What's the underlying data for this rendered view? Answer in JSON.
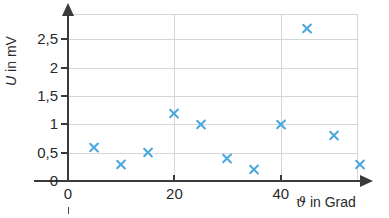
{
  "chart_data": {
    "type": "scatter",
    "title": "",
    "xlabel": "ϑ in Grad",
    "ylabel": "U in mV",
    "xlim": [
      0,
      54.5
    ],
    "ylim": [
      0,
      2.95
    ],
    "grid": true,
    "legend": null,
    "x": [
      5,
      10,
      15,
      20,
      25,
      30,
      35,
      40,
      45,
      50,
      55
    ],
    "y": [
      0.6,
      0.3,
      0.5,
      1.2,
      1.0,
      0.4,
      0.2,
      1.0,
      2.7,
      0.8,
      0.3
    ],
    "points": [
      {
        "x": 5,
        "y": 0.6
      },
      {
        "x": 10,
        "y": 0.3
      },
      {
        "x": 15,
        "y": 0.5
      },
      {
        "x": 20,
        "y": 1.2
      },
      {
        "x": 25,
        "y": 1.0
      },
      {
        "x": 30,
        "y": 0.4
      },
      {
        "x": 35,
        "y": 0.2
      },
      {
        "x": 40,
        "y": 1.0
      },
      {
        "x": 45,
        "y": 2.7
      },
      {
        "x": 50,
        "y": 0.8
      },
      {
        "x": 55,
        "y": 0.3
      }
    ],
    "marker": "x",
    "marker_color": "#4aa8dd",
    "x_ticks": [
      {
        "value": 0,
        "label": "0"
      },
      {
        "value": 20,
        "label": "20"
      },
      {
        "value": 40,
        "label": "40"
      }
    ],
    "y_ticks": [
      {
        "value": 0,
        "label": "0"
      },
      {
        "value": 0.5,
        "label": "0,5"
      },
      {
        "value": 1.0,
        "label": "1"
      },
      {
        "value": 1.5,
        "label": "1,5"
      },
      {
        "value": 2.0,
        "label": "2"
      },
      {
        "value": 2.5,
        "label": "2,5"
      }
    ],
    "grid_color": "#d5d6d8",
    "axis_color": "#3a3a3c"
  },
  "axis_titles": {
    "y_symbol": "U",
    "y_rest": " in mV",
    "x_symbol": "ϑ",
    "x_rest": " in Grad"
  }
}
